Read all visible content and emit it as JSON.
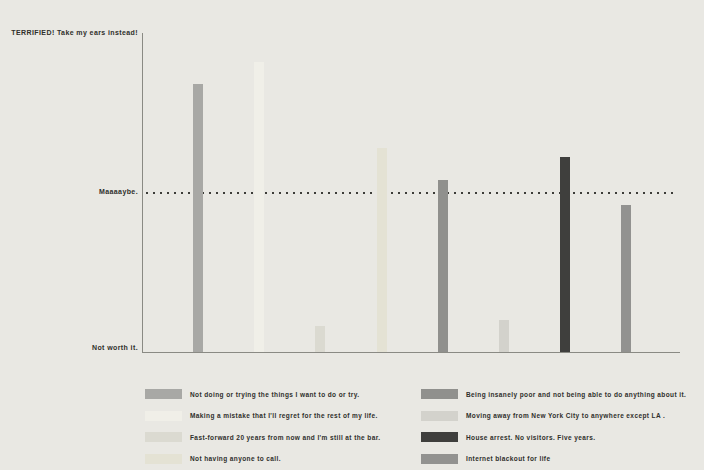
{
  "page": {
    "background": "#e9e8e3",
    "text_color": "#2f2f2b",
    "axis_color": "#8a8a84"
  },
  "chart_data": {
    "type": "bar",
    "y_axis": {
      "top_label": "TERRIFIED! Take my ears instead!",
      "bottom_label": "Not worth it.",
      "ylim": [
        0,
        100
      ]
    },
    "threshold_line": {
      "label": "Maaaaybe.",
      "value": 50,
      "style": "dotted"
    },
    "grid": false,
    "legend_position": "bottom",
    "series": [
      {
        "label": "Not doing or trying the things I want to do or try.",
        "value": 84,
        "color": "#a8a8a5"
      },
      {
        "label": "Making a mistake that I'll regret for the rest of my life.",
        "value": 91,
        "color": "#f0efe8"
      },
      {
        "label": "Fast-forward 20 years from now and I'm still at the bar.",
        "value": 8,
        "color": "#dbdad1"
      },
      {
        "label": "Not having anyone to call.",
        "value": 64,
        "color": "#e4e2d4"
      },
      {
        "label": "Being insanely poor and not being able to do anything about it.",
        "value": 54,
        "color": "#90908d"
      },
      {
        "label": "Moving away from New York City to anywhere except LA .",
        "value": 10,
        "color": "#d3d2cc"
      },
      {
        "label": "House arrest. No visitors. Five years.",
        "value": 61,
        "color": "#3f3f3d"
      },
      {
        "label": "Internet blackout for life",
        "value": 46,
        "color": "#929290"
      }
    ]
  }
}
